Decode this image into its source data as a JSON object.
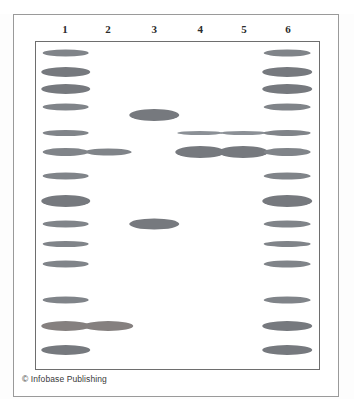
{
  "figure": {
    "kind": "gel-electrophoresis-diagram",
    "credit": "© Infobase Publishing",
    "lane_labels": [
      "1",
      "2",
      "3",
      "4",
      "5",
      "6"
    ],
    "colors": {
      "band": "#808489",
      "band_thin": "#8b9096",
      "band_heavy": "#76797e",
      "gel_border": "#6e6e6e",
      "outer_frame": "#9a9a9a",
      "background": "#ffffff",
      "label_text": "#2b2b2b",
      "credit_text": "#3a3a3a"
    }
  },
  "chart_data": {
    "type": "scatter",
    "title": "",
    "subtitle": "",
    "xlabel": "",
    "ylabel": "",
    "grid": false,
    "legend": "none",
    "x": [
      "1",
      "2",
      "3",
      "4",
      "5",
      "6"
    ],
    "axis_notes": {
      "x_axis": "lane number (1-6), left to right",
      "y_axis": "migration distance down the gel, top (large fragments) to bottom (small fragments)"
    },
    "lane_centers_pct": [
      10.5,
      25.6,
      41.8,
      58.0,
      73.3,
      88.8
    ],
    "series": [
      {
        "name": "Lane 1",
        "lane": "1",
        "band_count": 13,
        "bands": [
          {
            "y_pct": 3.3,
            "w_pct": 16.5,
            "h_px": 7,
            "weight": "normal"
          },
          {
            "y_pct": 9.1,
            "w_pct": 17.5,
            "h_px": 10,
            "weight": "heavy"
          },
          {
            "y_pct": 14.3,
            "w_pct": 17.5,
            "h_px": 10,
            "weight": "heavy"
          },
          {
            "y_pct": 19.8,
            "w_pct": 16.5,
            "h_px": 7,
            "weight": "normal"
          },
          {
            "y_pct": 27.8,
            "w_pct": 16.5,
            "h_px": 6,
            "weight": "normal"
          },
          {
            "y_pct": 33.6,
            "w_pct": 16.5,
            "h_px": 8,
            "weight": "normal"
          },
          {
            "y_pct": 41.0,
            "w_pct": 16.5,
            "h_px": 7,
            "weight": "normal"
          },
          {
            "y_pct": 48.6,
            "w_pct": 17.5,
            "h_px": 12,
            "weight": "heavy"
          },
          {
            "y_pct": 55.8,
            "w_pct": 16.5,
            "h_px": 7,
            "weight": "normal"
          },
          {
            "y_pct": 61.7,
            "w_pct": 16.5,
            "h_px": 6,
            "weight": "normal"
          },
          {
            "y_pct": 67.8,
            "w_pct": 16.5,
            "h_px": 7,
            "weight": "normal"
          },
          {
            "y_pct": 79.0,
            "w_pct": 16.5,
            "h_px": 7,
            "weight": "normal"
          },
          {
            "y_pct": 87.0,
            "w_pct": 17.5,
            "h_px": 10,
            "weight": "warm"
          },
          {
            "y_pct": 94.2,
            "w_pct": 17.5,
            "h_px": 10,
            "weight": "heavy"
          }
        ]
      },
      {
        "name": "Lane 2",
        "lane": "2",
        "band_count": 2,
        "bands": [
          {
            "y_pct": 33.6,
            "w_pct": 16.5,
            "h_px": 7,
            "weight": "normal"
          },
          {
            "y_pct": 87.0,
            "w_pct": 17.5,
            "h_px": 10,
            "weight": "warm"
          }
        ]
      },
      {
        "name": "Lane 3",
        "lane": "3",
        "band_count": 2,
        "bands": [
          {
            "y_pct": 22.2,
            "w_pct": 17.5,
            "h_px": 12,
            "weight": "heavy"
          },
          {
            "y_pct": 55.8,
            "w_pct": 17.5,
            "h_px": 11,
            "weight": "heavy"
          }
        ]
      },
      {
        "name": "Lane 4",
        "lane": "4",
        "band_count": 2,
        "bands": [
          {
            "y_pct": 27.8,
            "w_pct": 16.0,
            "h_px": 4,
            "weight": "thin"
          },
          {
            "y_pct": 33.6,
            "w_pct": 17.5,
            "h_px": 12,
            "weight": "heavy"
          }
        ]
      },
      {
        "name": "Lane 5",
        "lane": "5",
        "band_count": 2,
        "bands": [
          {
            "y_pct": 27.8,
            "w_pct": 16.0,
            "h_px": 4,
            "weight": "thin"
          },
          {
            "y_pct": 33.6,
            "w_pct": 17.5,
            "h_px": 12,
            "weight": "heavy"
          }
        ]
      },
      {
        "name": "Lane 6",
        "lane": "6",
        "band_count": 13,
        "bands": [
          {
            "y_pct": 3.3,
            "w_pct": 16.5,
            "h_px": 7,
            "weight": "normal"
          },
          {
            "y_pct": 9.1,
            "w_pct": 17.5,
            "h_px": 10,
            "weight": "heavy"
          },
          {
            "y_pct": 14.3,
            "w_pct": 17.5,
            "h_px": 10,
            "weight": "heavy"
          },
          {
            "y_pct": 19.8,
            "w_pct": 16.5,
            "h_px": 7,
            "weight": "normal"
          },
          {
            "y_pct": 27.8,
            "w_pct": 16.5,
            "h_px": 6,
            "weight": "normal"
          },
          {
            "y_pct": 33.6,
            "w_pct": 16.5,
            "h_px": 8,
            "weight": "normal"
          },
          {
            "y_pct": 41.0,
            "w_pct": 16.5,
            "h_px": 7,
            "weight": "normal"
          },
          {
            "y_pct": 48.6,
            "w_pct": 17.5,
            "h_px": 12,
            "weight": "heavy"
          },
          {
            "y_pct": 55.8,
            "w_pct": 16.5,
            "h_px": 7,
            "weight": "normal"
          },
          {
            "y_pct": 61.7,
            "w_pct": 16.5,
            "h_px": 6,
            "weight": "normal"
          },
          {
            "y_pct": 67.8,
            "w_pct": 16.5,
            "h_px": 7,
            "weight": "normal"
          },
          {
            "y_pct": 79.0,
            "w_pct": 16.5,
            "h_px": 7,
            "weight": "normal"
          },
          {
            "y_pct": 87.0,
            "w_pct": 17.5,
            "h_px": 10,
            "weight": "heavy"
          },
          {
            "y_pct": 94.2,
            "w_pct": 17.5,
            "h_px": 10,
            "weight": "heavy"
          }
        ]
      }
    ]
  }
}
